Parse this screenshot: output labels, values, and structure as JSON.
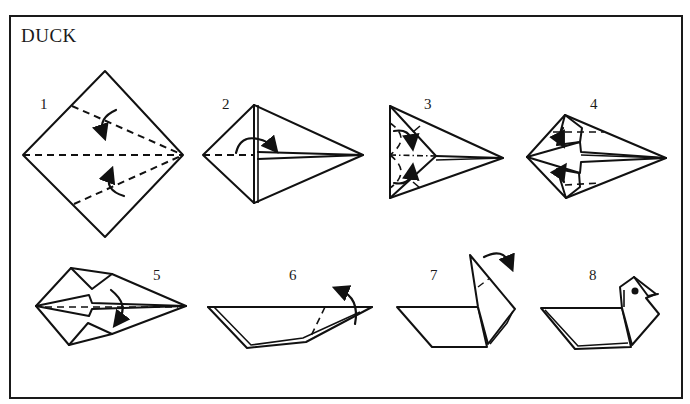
{
  "title": "DUCK",
  "steps": [
    {
      "number": "1",
      "description": "square base diamond with valley fold lines toward center"
    },
    {
      "number": "2",
      "description": "kite base, fold back along center"
    },
    {
      "number": "3",
      "description": "inside reverse folds at left end"
    },
    {
      "number": "4",
      "description": "tuck flaps"
    },
    {
      "number": "5",
      "description": "fold in half along center line"
    },
    {
      "number": "6",
      "description": "outside reverse fold neck upward"
    },
    {
      "number": "7",
      "description": "outside reverse fold head"
    },
    {
      "number": "8",
      "description": "finished duck"
    }
  ],
  "colors": {
    "line": "#111111",
    "background": "#ffffff"
  }
}
